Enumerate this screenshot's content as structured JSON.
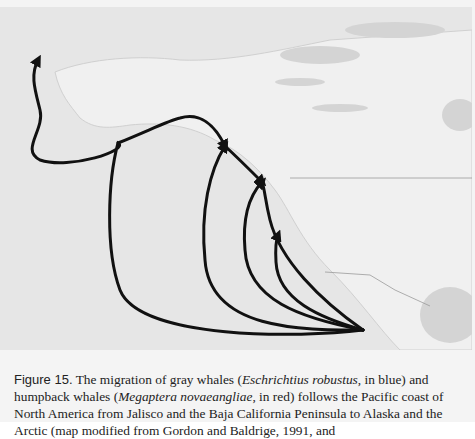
{
  "figure": {
    "label": "Figure 15.",
    "caption_parts": {
      "p1": " The migration of gray whales (",
      "species1": "Eschrichtius robustus",
      "p2": ", in blue) and humpback whales (",
      "species2": "Megaptera novaeangliae",
      "p3": ", in red) follows the Pacific coast of North America from Jalisco and the Baja California Peninsula to Alaska and the Arctic (map modified from Gordon and Baldrige, 1991, and"
    }
  },
  "map": {
    "region": "North America Pacific coast",
    "route_color": "#111111",
    "origin": [
      363,
      330
    ],
    "destinations": [
      "Arctic",
      "Alaska",
      "British Columbia",
      "Washington",
      "California"
    ]
  }
}
